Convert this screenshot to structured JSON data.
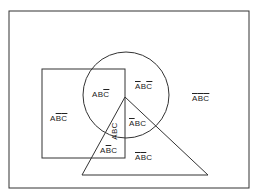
{
  "diagram": {
    "type": "venn",
    "sets": [
      {
        "name": "A",
        "shape": "square"
      },
      {
        "name": "B",
        "shape": "circle"
      },
      {
        "name": "C",
        "shape": "triangle"
      }
    ],
    "regions": [
      {
        "id": "a_b_notc",
        "text": "ABC",
        "overline": [
          false,
          false,
          true
        ]
      },
      {
        "id": "nota_b_notc",
        "text": "ABC",
        "overline": [
          true,
          false,
          true
        ]
      },
      {
        "id": "a_notb_notc",
        "text": "ABC",
        "overline": [
          false,
          true,
          true
        ]
      },
      {
        "id": "nota_notb_notc",
        "text": "ABC",
        "overline": [
          true,
          true,
          true
        ]
      },
      {
        "id": "a_b_c",
        "text": "ABC",
        "overline": [
          false,
          false,
          false
        ]
      },
      {
        "id": "nota_b_c",
        "text": "ABC",
        "overline": [
          true,
          false,
          false
        ]
      },
      {
        "id": "a_notb_c",
        "text": "ABC",
        "overline": [
          false,
          true,
          false
        ]
      },
      {
        "id": "nota_notb_c",
        "text": "ABC",
        "overline": [
          true,
          true,
          false
        ]
      }
    ],
    "colors": {
      "stroke": "#333333",
      "background": "#ffffff",
      "text": "#222222"
    }
  }
}
